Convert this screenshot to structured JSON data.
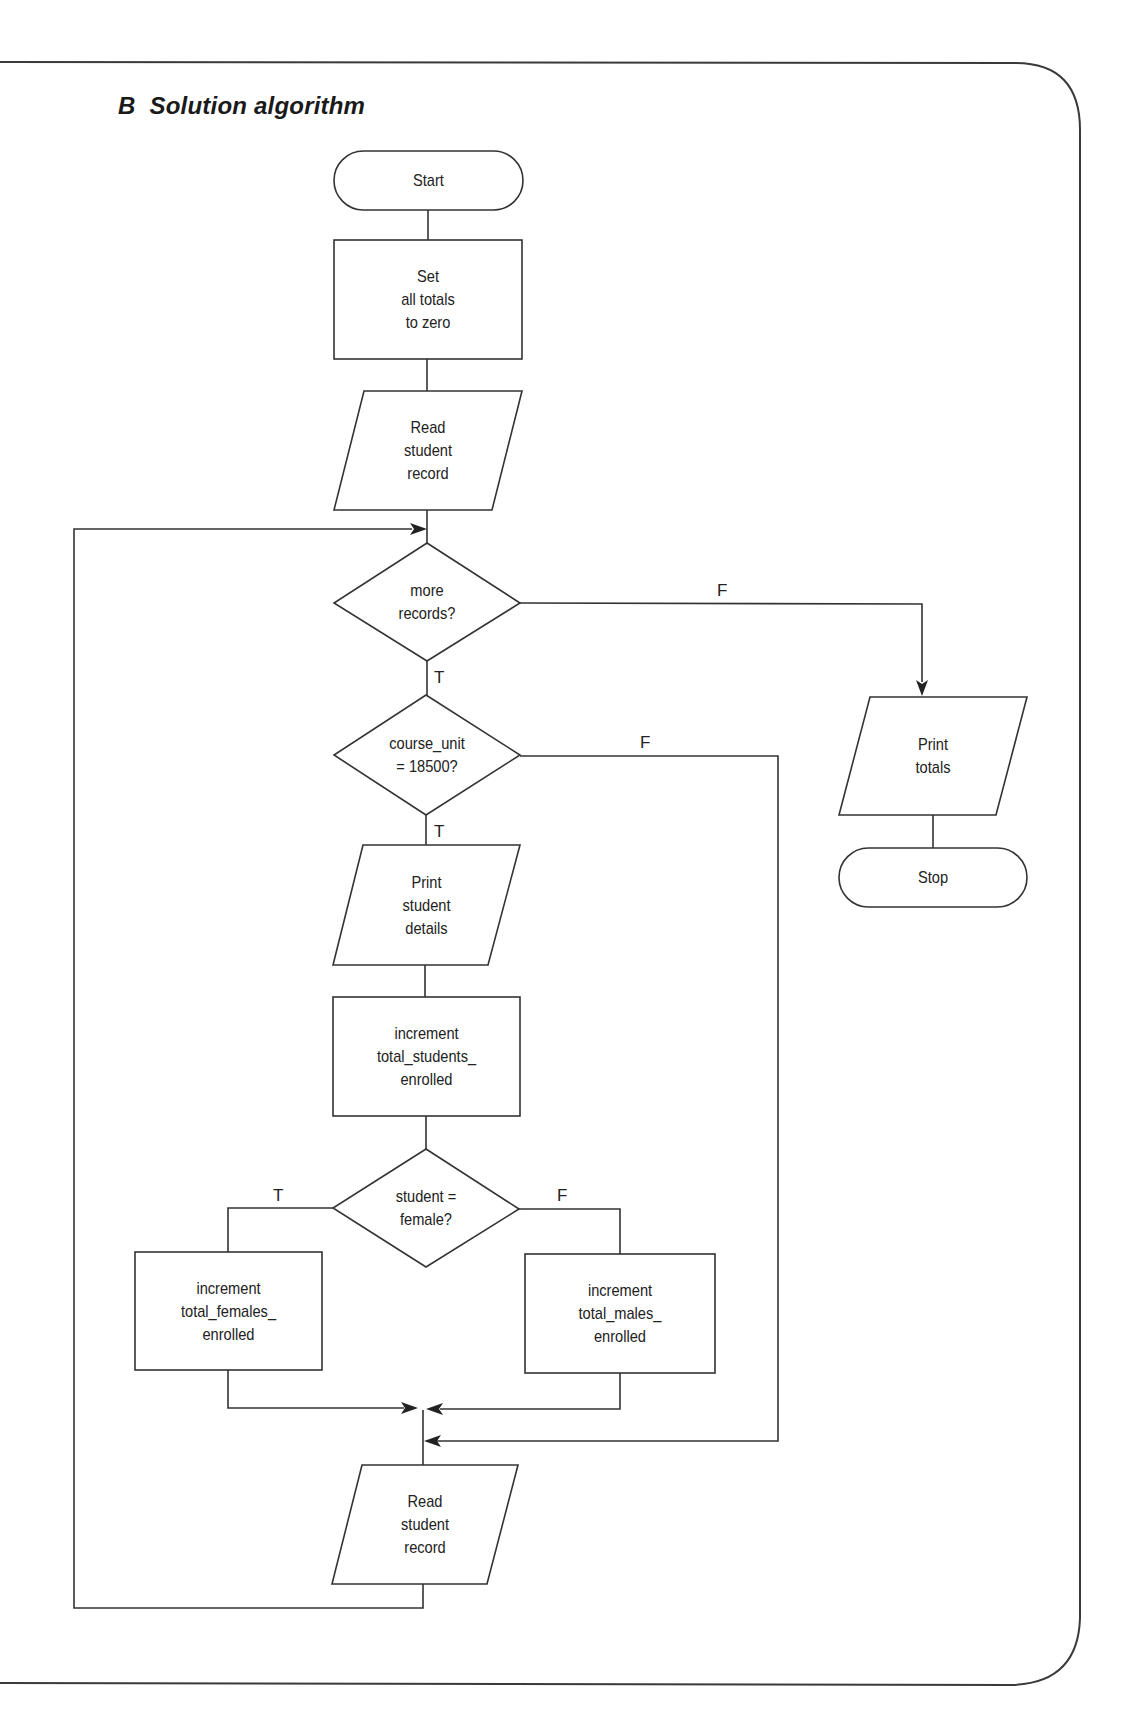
{
  "heading": {
    "letter": "B",
    "title": "Solution algorithm"
  },
  "colors": {
    "stroke": "#333333",
    "text": "#222222",
    "background": "#ffffff"
  },
  "flowchart": {
    "nodes": [
      {
        "id": "start",
        "type": "terminator",
        "label": "Start"
      },
      {
        "id": "set_totals",
        "type": "process",
        "label": "Set\nall totals\nto zero"
      },
      {
        "id": "read_record_1",
        "type": "input-output",
        "label": "Read\nstudent\nrecord"
      },
      {
        "id": "more_records",
        "type": "decision",
        "label": "more\nrecords?"
      },
      {
        "id": "course_unit",
        "type": "decision",
        "label": "course_unit\n= 18500?"
      },
      {
        "id": "print_details",
        "type": "input-output",
        "label": "Print\nstudent\ndetails"
      },
      {
        "id": "inc_students",
        "type": "process",
        "label": "increment\ntotal_students_\nenrolled"
      },
      {
        "id": "student_female",
        "type": "decision",
        "label": "student =\nfemale?"
      },
      {
        "id": "inc_females",
        "type": "process",
        "label": "increment\ntotal_females_\nenrolled"
      },
      {
        "id": "inc_males",
        "type": "process",
        "label": "increment\ntotal_males_\nenrolled"
      },
      {
        "id": "read_record_2",
        "type": "input-output",
        "label": "Read\nstudent\nrecord"
      },
      {
        "id": "print_totals",
        "type": "input-output",
        "label": "Print\ntotals"
      },
      {
        "id": "stop",
        "type": "terminator",
        "label": "Stop"
      }
    ],
    "branch_labels": {
      "more_records_true": "T",
      "more_records_false": "F",
      "course_unit_true": "T",
      "course_unit_false": "F",
      "female_true": "T",
      "female_false": "F"
    },
    "edges": [
      {
        "from": "start",
        "to": "set_totals"
      },
      {
        "from": "set_totals",
        "to": "read_record_1"
      },
      {
        "from": "read_record_1",
        "to": "more_records"
      },
      {
        "from": "more_records",
        "to": "course_unit",
        "label": "T"
      },
      {
        "from": "more_records",
        "to": "print_totals",
        "label": "F"
      },
      {
        "from": "course_unit",
        "to": "print_details",
        "label": "T"
      },
      {
        "from": "course_unit",
        "to": "read_record_2",
        "label": "F"
      },
      {
        "from": "print_details",
        "to": "inc_students"
      },
      {
        "from": "inc_students",
        "to": "student_female"
      },
      {
        "from": "student_female",
        "to": "inc_females",
        "label": "T"
      },
      {
        "from": "student_female",
        "to": "inc_males",
        "label": "F"
      },
      {
        "from": "inc_females",
        "to": "read_record_2"
      },
      {
        "from": "inc_males",
        "to": "read_record_2"
      },
      {
        "from": "read_record_2",
        "to": "more_records"
      },
      {
        "from": "print_totals",
        "to": "stop"
      }
    ]
  }
}
